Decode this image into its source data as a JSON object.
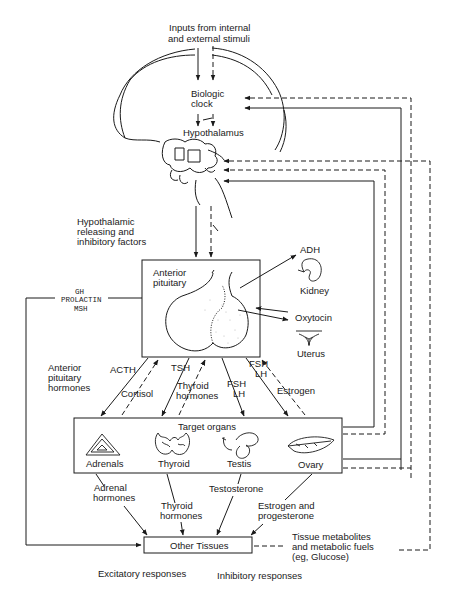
{
  "inputs": {
    "line1": "Inputs from internal",
    "line2": "and external stimuli"
  },
  "biologic_clock": {
    "line1": "Biologic",
    "line2": "clock"
  },
  "hypothalamus": "Hypothalamus",
  "hypothalamic_factors": {
    "line1": "Hypothalamic",
    "line2": "releasing and",
    "line3": "inhibitory factors"
  },
  "anterior_pituitary": {
    "line1": "Anterior",
    "line2": "pituitary"
  },
  "posterior_outputs": {
    "adh": "ADH",
    "kidney": "Kidney",
    "oxytocin": "Oxytocin",
    "uterus": "Uterus"
  },
  "direct_hormones": {
    "line1": "GH",
    "line2": "PROLACTIN",
    "line3": "MSH"
  },
  "anterior_pituitary_hormones": {
    "line1": "Anterior",
    "line2": "pituitary",
    "line3": "hormones"
  },
  "pituitary_to_target": {
    "acth": "ACTH",
    "cortisol": "Cortisol",
    "tsh": "TSH",
    "thyroid_hormones": {
      "line1": "Thyroid",
      "line2": "hormones"
    },
    "fsh_lh_1": {
      "line1": "FSH",
      "line2": "LH"
    },
    "fsh_lh_2": {
      "line1": "FSH",
      "line2": "LH"
    },
    "estrogen": "Estrogen"
  },
  "target_organs": {
    "title": "Target organs",
    "items": [
      {
        "label": "Adrenals"
      },
      {
        "label": "Thyroid"
      },
      {
        "label": "Testis"
      },
      {
        "label": "Ovary"
      }
    ]
  },
  "target_outputs": {
    "adrenal_hormones": {
      "line1": "Adrenal",
      "line2": "hormones"
    },
    "thyroid_hormones": {
      "line1": "Thyroid",
      "line2": "hormones"
    },
    "testosterone": "Testosterone",
    "estrogen_progesterone": {
      "line1": "Estrogen and",
      "line2": "progesterone"
    }
  },
  "other_tissues": "Other Tissues",
  "tissue_metabolites": {
    "line1": "Tissue metabolites",
    "line2": "and metabolic fuels",
    "line3": "(eg, Glucose)"
  },
  "legend": {
    "excitatory": "Excitatory responses",
    "inhibitory": "Inhibitory responses"
  }
}
